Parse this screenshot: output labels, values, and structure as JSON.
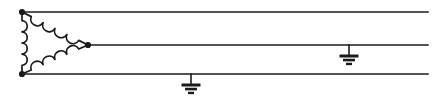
{
  "diagram": {
    "width": 433,
    "height": 98,
    "background_color": "#ffffff",
    "line_color": "#1a1a1a",
    "line_width": 1.6,
    "coil_line_width": 1.7
  },
  "winding": {
    "type": "delta",
    "label": "delta-winding",
    "coil_count": 3,
    "nodes": [
      {
        "name": "top-left-terminal",
        "x": 22,
        "y": 12
      },
      {
        "name": "bottom-left-terminal",
        "x": 22,
        "y": 74
      },
      {
        "name": "right-apex-terminal",
        "x": 88,
        "y": 45
      }
    ],
    "node_radius": 3.1,
    "coils": [
      {
        "name": "coil-left",
        "from": "top-left-terminal",
        "to": "bottom-left-terminal",
        "bumps": 4,
        "bump_direction": "right"
      },
      {
        "name": "coil-top",
        "from": "top-left-terminal",
        "to": "right-apex-terminal",
        "bumps": 4,
        "bump_direction": "up-right"
      },
      {
        "name": "coil-bottom",
        "from": "bottom-left-terminal",
        "to": "right-apex-terminal",
        "bumps": 4,
        "bump_direction": "down-right"
      }
    ]
  },
  "conductors": [
    {
      "name": "line-top",
      "y": 12,
      "x_start": 22,
      "x_end": 428
    },
    {
      "name": "line-middle",
      "y": 45,
      "x_start": 88,
      "x_end": 428
    },
    {
      "name": "line-bottom",
      "y": 74,
      "x_start": 22,
      "x_end": 428
    }
  ],
  "grounds": [
    {
      "name": "ground-bottom-line",
      "attached_to": "line-bottom",
      "x": 191,
      "y_top": 74,
      "stem_length": 11,
      "bars": [
        {
          "half_width": 9.5,
          "thickness": 3.0
        },
        {
          "half_width": 6.0,
          "thickness": 2.6
        },
        {
          "half_width": 3.0,
          "thickness": 2.4
        }
      ],
      "bar_gap": 3.0
    },
    {
      "name": "ground-middle-line",
      "attached_to": "line-middle",
      "x": 349,
      "y_top": 45,
      "stem_length": 11,
      "bars": [
        {
          "half_width": 9.5,
          "thickness": 3.0
        },
        {
          "half_width": 6.0,
          "thickness": 2.6
        },
        {
          "half_width": 3.0,
          "thickness": 2.4
        }
      ],
      "bar_gap": 3.0
    }
  ]
}
